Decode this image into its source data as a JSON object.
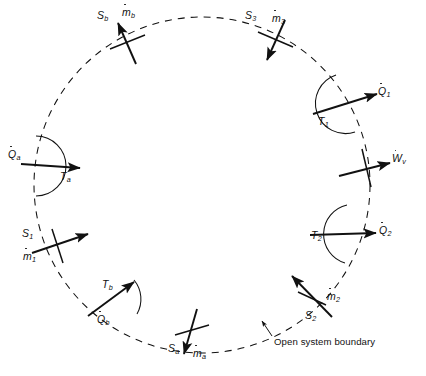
{
  "figure": {
    "kind": "thermodynamic-open-system-diagram",
    "boundary": {
      "shape": "dashed-circle",
      "center_x": 202,
      "center_y": 185,
      "radius": 168,
      "stroke_color": "#111111",
      "dash": "7 6",
      "caption": "Open system boundary",
      "caption_x": 272,
      "caption_y": 339,
      "leader": {
        "from_x": 270,
        "from_y": 336,
        "to_x": 262,
        "to_y": 322
      }
    },
    "streams": [
      {
        "id": "b",
        "entropy_label": "S",
        "entropy_sub": "b",
        "mass_label": "m",
        "mass_sub": "b",
        "direction": "inward",
        "entropy_x": 99,
        "entropy_y": 11,
        "mass_x": 122,
        "mass_y": 8,
        "arrow": {
          "x1": 135,
          "y1": 62,
          "x2": 118,
          "y2": 22
        },
        "tick": {
          "x1": 110,
          "y1": 48,
          "x2": 144,
          "y2": 36
        }
      },
      {
        "id": "3",
        "entropy_label": "S",
        "entropy_sub": "3",
        "mass_label": "m",
        "mass_sub": "3",
        "direction": "inward",
        "entropy_x": 246,
        "entropy_y": 11,
        "mass_x": 272,
        "mass_y": 12,
        "arrow": {
          "x1": 283,
          "y1": 22,
          "x2": 268,
          "y2": 59
        },
        "tick": {
          "x1": 259,
          "y1": 33,
          "x2": 292,
          "y2": 46
        }
      },
      {
        "id": "1",
        "entropy_label": "S",
        "entropy_sub": "1",
        "mass_label": "m",
        "mass_sub": "1",
        "direction": "inward",
        "entropy_x": 23,
        "entropy_y": 229,
        "mass_x": 24,
        "mass_y": 250,
        "arrow": {
          "x1": 34,
          "y1": 253,
          "x2": 86,
          "y2": 235
        },
        "tick": {
          "x1": 52,
          "y1": 230,
          "x2": 62,
          "y2": 262
        }
      },
      {
        "id": "2",
        "entropy_label": "S",
        "entropy_sub": "2",
        "mass_label": "m",
        "mass_sub": "2",
        "direction": "inward",
        "entropy_x": 306,
        "entropy_y": 311,
        "mass_x": 326,
        "mass_y": 292,
        "arrow": {
          "x1": 330,
          "y1": 315,
          "x2": 293,
          "y2": 277
        },
        "tick": {
          "x1": 299,
          "y1": 292,
          "x2": 325,
          "y2": 304
        }
      },
      {
        "id": "a",
        "entropy_label": "S",
        "entropy_sub": "a",
        "mass_label": "m",
        "mass_sub": "a",
        "direction": "outward",
        "entropy_x": 169,
        "entropy_y": 344,
        "mass_x": 193,
        "mass_y": 347,
        "arrow": {
          "x1": 196,
          "y1": 312,
          "x2": 183,
          "y2": 352
        },
        "tick": {
          "x1": 176,
          "y1": 334,
          "x2": 208,
          "y2": 326
        }
      }
    ],
    "heat_transfers": [
      {
        "id": "a",
        "heat_label": "Q",
        "heat_sub": "a",
        "temp_label": "T",
        "temp_sub": "a",
        "direction": "inward",
        "heat_x": 10,
        "heat_y": 151,
        "temp_x": 62,
        "temp_y": 172,
        "arrow": {
          "x1": 22,
          "y1": 164,
          "x2": 78,
          "y2": 168
        },
        "arc": {
          "cx": 35,
          "cy": 166,
          "r": 30,
          "start_deg": -88,
          "end_deg": 88
        }
      },
      {
        "id": "1",
        "heat_label": "Q",
        "heat_sub": "1",
        "temp_label": "T",
        "temp_sub": "1",
        "direction": "outward",
        "heat_x": 379,
        "heat_y": 88,
        "temp_x": 319,
        "temp_y": 116,
        "arrow": {
          "x1": 314,
          "y1": 113,
          "x2": 374,
          "y2": 95
        },
        "arc": {
          "cx": 344,
          "cy": 104,
          "r": 30,
          "start_deg": 105,
          "end_deg": 290
        }
      },
      {
        "id": "2",
        "heat_label": "Q",
        "heat_sub": "2",
        "temp_label": "T",
        "temp_sub": "2",
        "direction": "outward",
        "heat_x": 380,
        "heat_y": 227,
        "temp_x": 312,
        "temp_y": 232,
        "arrow": {
          "x1": 311,
          "y1": 235,
          "x2": 374,
          "y2": 233
        },
        "arc": {
          "cx": 341,
          "cy": 234,
          "r": 30,
          "start_deg": 100,
          "end_deg": 278
        }
      },
      {
        "id": "b",
        "heat_label": "Q",
        "heat_sub": "b",
        "temp_label": "T",
        "temp_sub": "b",
        "direction": "inward",
        "heat_x": 98,
        "heat_y": 315,
        "temp_x": 103,
        "temp_y": 281,
        "arrow": {
          "x1": 90,
          "y1": 314,
          "x2": 132,
          "y2": 284
        },
        "arc": {
          "cx": 111,
          "cy": 299,
          "r": 30,
          "start_deg": -40,
          "end_deg": 150
        }
      }
    ],
    "work": {
      "id": "v",
      "label": "W",
      "sub": "v",
      "direction": "outward",
      "label_x": 391,
      "label_y": 155,
      "arrow": {
        "x1": 341,
        "y1": 175,
        "x2": 388,
        "y2": 163
      },
      "tick": {
        "x1": 362,
        "y1": 150,
        "x2": 370,
        "y2": 186
      }
    }
  }
}
